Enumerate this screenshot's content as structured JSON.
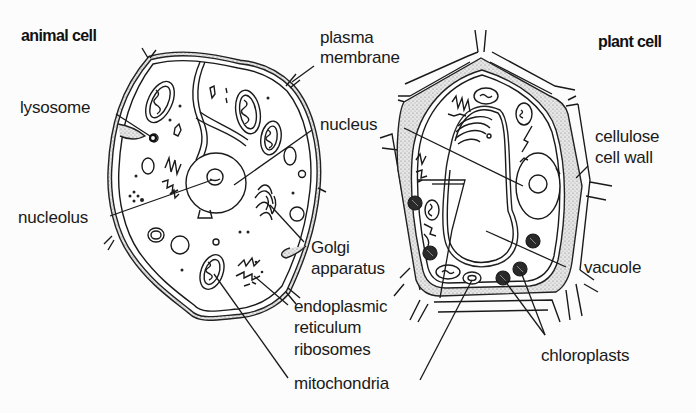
{
  "diagram": {
    "panels": [
      {
        "id": "animal",
        "title": "animal cell",
        "labels": {
          "lysosome": "lysosome",
          "nucleolus": "nucleolus",
          "plasma_membrane_1": "plasma",
          "plasma_membrane_2": "membrane",
          "nucleus": "nucleus",
          "golgi_1": "Golgi",
          "golgi_2": "apparatus",
          "er_1": "endoplasmic",
          "er_2": "reticulum",
          "ribosomes": "ribosomes",
          "mitochondria": "mitochondria"
        }
      },
      {
        "id": "plant",
        "title": "plant cell",
        "labels": {
          "cell_wall_1": "cellulose",
          "cell_wall_2": "cell wall",
          "vacuole": "vacuole",
          "chloroplasts": "chloroplasts"
        }
      }
    ],
    "colors": {
      "ink": "#1a1a1a",
      "background": "#fcfcfc",
      "stipple": "#bdbdbd",
      "chloroplast_fill": "#2a2a2a"
    }
  }
}
